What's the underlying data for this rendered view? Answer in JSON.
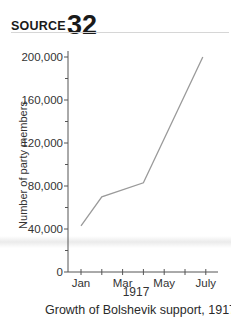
{
  "header": {
    "source_word": "SOURCE",
    "source_number": "32"
  },
  "caption": "Growth of Bolshevik support, 1917.",
  "colors": {
    "line": "#9a9a9a",
    "axis": "#555555",
    "text": "#333333"
  },
  "chart_data": {
    "type": "line",
    "title": "",
    "caption": "Growth of Bolshevik support, 1917.",
    "xlabel": "1917",
    "ylabel": "Number of party members",
    "x_tick_labels": [
      "Jan",
      "Mar",
      "May",
      "July"
    ],
    "months": [
      "Jan",
      "Feb",
      "Mar",
      "Apr",
      "May",
      "Jun",
      "July"
    ],
    "categories": [
      "Jan",
      "Feb",
      "Apr",
      "July"
    ],
    "values": [
      43000,
      70000,
      83000,
      200000
    ],
    "series": [
      {
        "name": "Bolshevik party members",
        "x": [
          "Jan",
          "Feb",
          "Apr",
          "July"
        ],
        "values": [
          43000,
          70000,
          83000,
          200000
        ]
      }
    ],
    "y_ticks": [
      0,
      40000,
      80000,
      120000,
      160000,
      200000
    ],
    "y_tick_labels": [
      "0",
      "40,000",
      "80,000",
      "120,000",
      "160,000",
      "200,000"
    ],
    "ylim": [
      0,
      200000
    ],
    "grid": false,
    "legend": "none"
  }
}
